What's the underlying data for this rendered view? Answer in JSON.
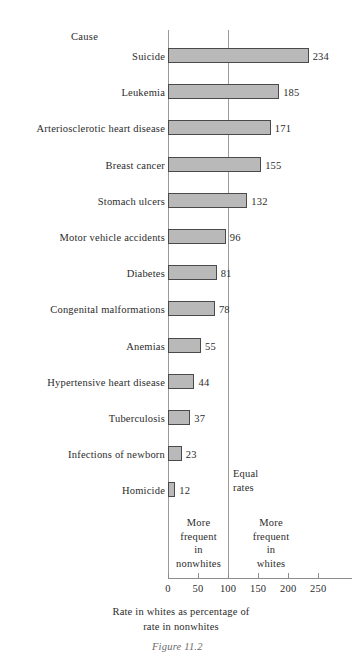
{
  "chart_data": {
    "type": "bar",
    "orientation": "horizontal",
    "title": "",
    "category_header": "Cause",
    "categories": [
      "Suicide",
      "Leukemia",
      "Arteriosclerotic heart disease",
      "Breast cancer",
      "Stomach ulcers",
      "Motor vehicle accidents",
      "Diabetes",
      "Congenital malformations",
      "Anemias",
      "Hypertensive heart disease",
      "Tuberculosis",
      "Infections of newborn",
      "Homicide"
    ],
    "values": [
      234,
      185,
      171,
      155,
      132,
      96,
      81,
      78,
      55,
      44,
      37,
      23,
      12
    ],
    "value_labels": [
      "234",
      "185",
      "171",
      "155",
      "132",
      "96",
      "81",
      "78",
      "55",
      "44",
      "37",
      "23",
      "12"
    ],
    "xlabel": "Rate in whites as percentage of rate in nonwhites",
    "xlabel_line1": "Rate in whites as percentage of",
    "xlabel_line2": "rate in nonwhites",
    "ylabel": "",
    "xlim": [
      0,
      260
    ],
    "xticks": [
      0,
      50,
      100,
      150,
      200,
      250
    ],
    "xtick_labels": [
      "0",
      "50",
      "100",
      "150",
      "200",
      "250"
    ],
    "grid": false,
    "gridlines_at": [
      0,
      100
    ],
    "reference_line": 100,
    "legend": "none",
    "bar_fill_color": "#b9b9b9",
    "bar_border_color": "#4a4a4a",
    "axis_color": "#8d8d8d"
  },
  "annotations": {
    "equal_rates": "Equal\nrates",
    "more_frequent_nonwhites": "More\nfrequent\nin\nnonwhites",
    "more_frequent_whites": "More\nfrequent\nin\nwhites"
  },
  "caption": {
    "text": "Figure 11.2"
  }
}
